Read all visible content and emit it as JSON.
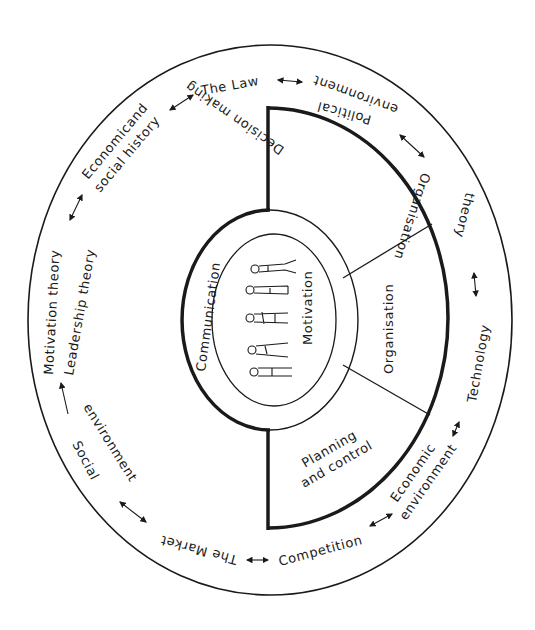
{
  "diagram": {
    "colors": {
      "ink": "#1a1a1a",
      "background": "#ffffff"
    },
    "core": {
      "label": "Motivation",
      "figures": [
        "person-figure-1",
        "person-figure-2",
        "person-figure-3",
        "person-figure-4",
        "person-figure-5"
      ]
    },
    "inner_ring": {
      "label": "Communication"
    },
    "segments": [
      {
        "label": "Decision making"
      },
      {
        "label": "Organisation"
      },
      {
        "label_line1": "Planning",
        "label_line2": "and control"
      }
    ],
    "outer_ring": [
      {
        "label": "The Law"
      },
      {
        "label_line1": "Political",
        "label_line2": "environment"
      },
      {
        "label_line1": "Organisation",
        "label_line2": "theory"
      },
      {
        "label": "Technology"
      },
      {
        "label_line1": "Economic",
        "label_line2": "environment"
      },
      {
        "label": "Competition"
      },
      {
        "label": "The Market"
      },
      {
        "label_line1": "Social",
        "label_line2": "environment"
      },
      {
        "label_line1": "Motivation theory",
        "label_line2": "Leadership theory"
      },
      {
        "label_line1": "Economicand",
        "label_line2": "social history"
      }
    ]
  }
}
